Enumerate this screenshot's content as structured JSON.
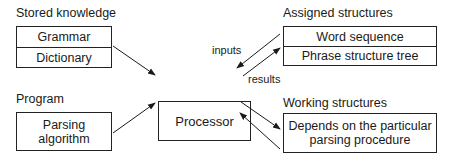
{
  "stored_knowledge": {
    "label": "Stored knowledge",
    "items": [
      "Grammar",
      "Dictionary"
    ]
  },
  "program": {
    "label": "Program",
    "lines": [
      "Parsing",
      "algorithm"
    ]
  },
  "processor": {
    "label": "Processor"
  },
  "assigned_structures": {
    "label": "Assigned structures",
    "items": [
      "Word sequence",
      "Phrase structure tree"
    ]
  },
  "working_structures": {
    "label": "Working structures",
    "lines": [
      "Depends on the particular",
      "parsing procedure"
    ]
  },
  "arrow_labels": {
    "inputs": "inputs",
    "results": "results"
  }
}
